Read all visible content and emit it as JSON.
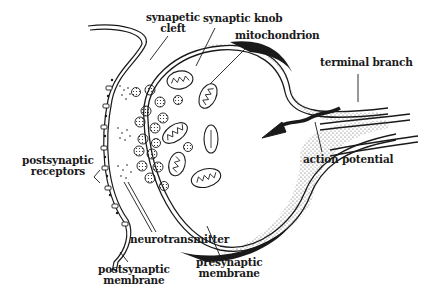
{
  "diagram": {
    "colors": {
      "ink": "#1a1a1a",
      "background": "#ffffff"
    },
    "labels": {
      "synaptic_cleft": [
        "synapetic",
        "cleft"
      ],
      "synaptic_knob": "synaptic knob",
      "mitochondrion": "mitochondrion",
      "terminal_branch": "terminal branch",
      "action_potential": "action potential",
      "postsynaptic_receptors": [
        "postsynaptic",
        "receptors"
      ],
      "neurotransmitter": "neurotransmitter",
      "presynaptic_membrane": [
        "presynaptic",
        "membrane"
      ],
      "postsynaptic_membrane": [
        "postsynaptic",
        "membrane"
      ]
    }
  }
}
